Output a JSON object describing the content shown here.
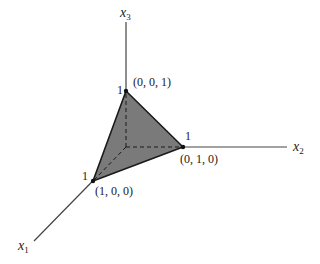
{
  "diagram": {
    "type": "3d-simplex",
    "axes": [
      {
        "name": "x1",
        "label": "x",
        "subscript": "1"
      },
      {
        "name": "x2",
        "label": "x",
        "subscript": "2"
      },
      {
        "name": "x3",
        "label": "x",
        "subscript": "3"
      }
    ],
    "vertices": [
      {
        "name": "e1",
        "coords": "(1, 0, 0)",
        "tick": "1"
      },
      {
        "name": "e2",
        "coords": "(0, 1, 0)",
        "tick": "1"
      },
      {
        "name": "e3",
        "coords": "(0, 0, 1)",
        "tick": "1"
      }
    ],
    "face_color": "#7a7a7a",
    "edge_color": "#1a1a1a"
  }
}
